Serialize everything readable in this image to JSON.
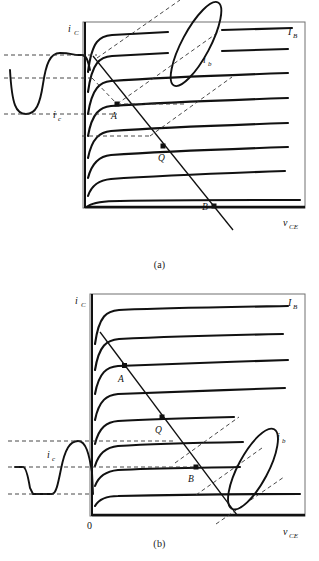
{
  "document": {
    "type": "transistor-output-characteristics-load-line-diagram",
    "figures": [
      {
        "id": "a",
        "caption": "(a)",
        "axes": {
          "y_label": "i_C",
          "y_label_main": "i",
          "y_label_sub": "C",
          "x_label": "v_CE",
          "x_label_main": "v",
          "x_label_sub": "CE",
          "origin_label": ""
        },
        "labels": {
          "family_label_main": "I",
          "family_label_sub": "B",
          "base_signal_main": "i",
          "base_signal_sub": "b",
          "collector_signal_main": "i",
          "collector_signal_sub": "c"
        },
        "points": [
          {
            "name": "A",
            "x": 117,
            "y": 104
          },
          {
            "name": "Q",
            "x": 163,
            "y": 146
          },
          {
            "name": "B",
            "x": 214,
            "y": 206
          }
        ],
        "curve_count": 8,
        "clipping": "top",
        "description": "Output waveform clipped at positive peak (saturation clipping)"
      },
      {
        "id": "b",
        "caption": "(b)",
        "axes": {
          "y_label": "i_C",
          "y_label_main": "i",
          "y_label_sub": "C",
          "x_label": "v_CE",
          "x_label_main": "v",
          "x_label_sub": "CE",
          "origin_label": "0"
        },
        "labels": {
          "family_label_main": "I",
          "family_label_sub": "B",
          "base_signal_main": "i",
          "base_signal_sub": "b",
          "collector_signal_main": "i",
          "collector_signal_sub": "c"
        },
        "points": [
          {
            "name": "A",
            "x": 124,
            "y": 355
          },
          {
            "name": "Q",
            "x": 162,
            "y": 399
          },
          {
            "name": "B",
            "x": 217,
            "y": 462
          }
        ],
        "curve_count": 8,
        "clipping": "bottom",
        "description": "Output waveform clipped at negative peak (cutoff clipping)"
      }
    ],
    "colors": {
      "ink": "#111111",
      "frame": "#555555",
      "dashed": "#333333",
      "background": "#ffffff"
    }
  }
}
